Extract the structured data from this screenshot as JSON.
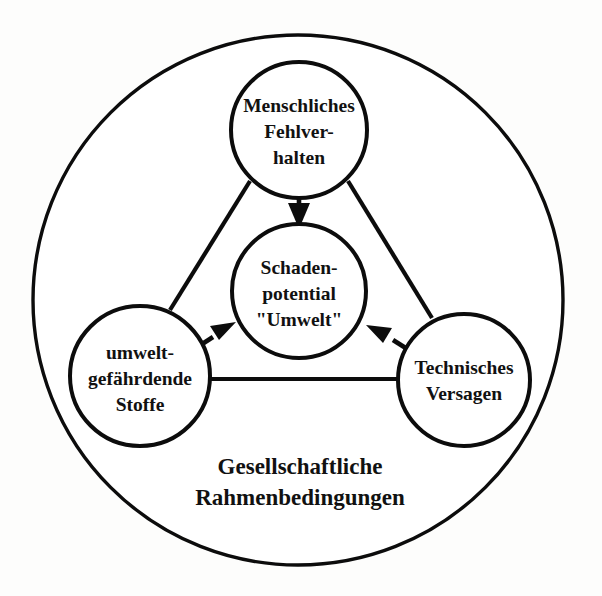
{
  "diagram": {
    "background_color": "#fdfdfc",
    "line_color": "#0c0c0c",
    "text_color": "#111111",
    "outer_ring": {
      "name": "gesellschaftliche-rahmenbedingungen-ring",
      "cx": 298,
      "cy": 300,
      "r": 265
    },
    "caption": {
      "line1": "Gesellschaftliche",
      "line2": "Rahmenbedingungen",
      "x": 300,
      "y1": 466,
      "y2": 497
    },
    "nodes": {
      "top": {
        "id": "menschliches-fehlverhalten",
        "lines": [
          "Menschliches",
          "Fehlver-",
          "halten"
        ],
        "cx": 299,
        "cy": 130,
        "r": 68
      },
      "center": {
        "id": "schadenpotential-umwelt",
        "lines": [
          "Schaden-",
          "potential",
          "\"Umwelt\""
        ],
        "cx": 299,
        "cy": 291,
        "r": 67
      },
      "left": {
        "id": "umweltgefaehrdende-stoffe",
        "lines": [
          "umwelt-",
          "gefährdende",
          "Stoffe"
        ],
        "cx": 140,
        "cy": 376,
        "r": 70
      },
      "right": {
        "id": "technisches-versagen",
        "lines": [
          "Technisches",
          "Versagen"
        ],
        "cx": 464,
        "cy": 380,
        "r": 66
      }
    },
    "connectors": [
      {
        "id": "top-to-left",
        "from": "top",
        "to": "left"
      },
      {
        "id": "top-to-right",
        "from": "top",
        "to": "right"
      },
      {
        "id": "left-to-right",
        "from": "left",
        "to": "right"
      }
    ],
    "arrows": [
      {
        "id": "arrow-top-to-center",
        "from": "top",
        "to": "center",
        "direction": "down"
      },
      {
        "id": "arrow-left-to-center",
        "from": "left",
        "to": "center",
        "direction": "up-right"
      },
      {
        "id": "arrow-right-to-center",
        "from": "right",
        "to": "center",
        "direction": "up-left"
      }
    ]
  }
}
